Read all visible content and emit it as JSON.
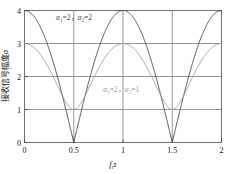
{
  "chart_data": {
    "type": "line",
    "title": "",
    "xlabel": "fτ τ",
    "ylabel": "接收信号幅度α",
    "xlim": [
      0,
      2
    ],
    "ylim": [
      0,
      4
    ],
    "xticks": [
      "0",
      "0.5",
      "1",
      "1.5",
      "2"
    ],
    "xtick_values": [
      0,
      0.5,
      1,
      1.5,
      2
    ],
    "yticks": [
      "0",
      "1",
      "2",
      "3",
      "4"
    ],
    "ytick_values": [
      0,
      1,
      2,
      3,
      4
    ],
    "grid": true,
    "legend_position": "inline-annotation",
    "series": [
      {
        "name": "α₁=2，α₂=2",
        "color": "#4d4d4d",
        "formula": "|2 + 2·exp(j2πx)|",
        "max": 4,
        "min": 0,
        "period": 1,
        "zeros_at": [
          0.5,
          1.5
        ],
        "peaks_at": [
          0,
          1,
          2
        ],
        "x": [
          0,
          0.05,
          0.1,
          0.15,
          0.2,
          0.25,
          0.3,
          0.35,
          0.4,
          0.45,
          0.5,
          0.55,
          0.6,
          0.65,
          0.7,
          0.75,
          0.8,
          0.85,
          0.9,
          0.95,
          1.0,
          1.05,
          1.1,
          1.15,
          1.2,
          1.25,
          1.3,
          1.35,
          1.4,
          1.45,
          1.5,
          1.55,
          1.6,
          1.65,
          1.7,
          1.75,
          1.8,
          1.85,
          1.9,
          1.95,
          2.0
        ],
        "y": [
          4.0,
          3.951,
          3.804,
          3.564,
          3.236,
          2.828,
          2.351,
          1.816,
          1.236,
          0.627,
          0.0,
          0.627,
          1.236,
          1.816,
          2.351,
          2.828,
          3.236,
          3.564,
          3.804,
          3.951,
          4.0,
          3.951,
          3.804,
          3.564,
          3.236,
          2.828,
          2.351,
          1.816,
          1.236,
          0.627,
          0.0,
          0.627,
          1.236,
          1.816,
          2.351,
          2.828,
          3.236,
          3.564,
          3.804,
          3.951,
          4.0
        ]
      },
      {
        "name": "α₁=2，α₂=1",
        "color": "#9a9a9a",
        "formula": "|2 + 1·exp(j2πx)|",
        "max": 3,
        "min": 1,
        "period": 1,
        "minima_at": [
          0.5,
          1.5
        ],
        "peaks_at": [
          0,
          1,
          2
        ],
        "x": [
          0,
          0.05,
          0.1,
          0.15,
          0.2,
          0.25,
          0.3,
          0.35,
          0.4,
          0.45,
          0.5,
          0.55,
          0.6,
          0.65,
          0.7,
          0.75,
          0.8,
          0.85,
          0.9,
          0.95,
          1.0,
          1.05,
          1.1,
          1.15,
          1.2,
          1.25,
          1.3,
          1.35,
          1.4,
          1.45,
          1.5,
          1.55,
          1.6,
          1.65,
          1.7,
          1.75,
          1.8,
          1.85,
          1.9,
          1.95,
          2.0
        ],
        "y": [
          3.0,
          2.988,
          2.951,
          2.891,
          2.809,
          2.708,
          2.592,
          2.466,
          2.336,
          2.208,
          2.089,
          1.985,
          1.902,
          1.847,
          1.824,
          1.836,
          1.883,
          1.963,
          2.073,
          2.206,
          2.356,
          2.516,
          2.678,
          2.832,
          2.968,
          3.077,
          3.149,
          3.177,
          3.157,
          3.09,
          2.981,
          2.838,
          2.674,
          2.503,
          2.343,
          2.208,
          2.112,
          2.062,
          2.06,
          2.103,
          2.183
        ]
      }
    ],
    "annotations": [
      {
        "id": "anno-top",
        "text": "α₁=2，α₂=2",
        "alpha1_label": "α",
        "alpha1_sub": "1",
        "alpha1_value": "=2，",
        "alpha2_label": "α",
        "alpha2_sub": "2",
        "alpha2_value": "=2",
        "x": 0.32,
        "y": 3.72
      },
      {
        "id": "anno-mid",
        "text": "α₁=2，α₂=1",
        "alpha1_label": "α",
        "alpha1_sub": "1",
        "alpha1_value": "=2，",
        "alpha2_label": "α",
        "alpha2_sub": "2",
        "alpha2_value": "=1",
        "x": 0.8,
        "y": 1.52
      }
    ],
    "xlabel_parts": {
      "f": "f",
      "sub": "τ",
      "tau": "τ"
    },
    "ylabel_parts": {
      "chinese": "接收信号幅度",
      "symbol": "α"
    }
  },
  "colors": {
    "series1": "#4d4d4d",
    "series2": "#9a9a9a",
    "grid": "#8a8a8a",
    "frame": "#6f6f6f",
    "text": "#111111",
    "background": "#ffffff"
  }
}
